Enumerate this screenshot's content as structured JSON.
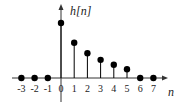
{
  "chart_data": {
    "type": "stem",
    "title": "",
    "ylabel": "h[n]",
    "xlabel": "n",
    "x": [
      -3,
      -2,
      -1,
      0,
      1,
      2,
      3,
      4,
      5,
      6,
      7
    ],
    "values": [
      0,
      0,
      0,
      1.0,
      0.64,
      0.45,
      0.33,
      0.24,
      0.16,
      0,
      0
    ],
    "tick_labels": [
      "-3",
      "-2",
      "-1",
      "0",
      "1",
      "2",
      "3",
      "4",
      "5",
      "6",
      "7"
    ],
    "xlim": [
      -3.5,
      7.6
    ],
    "ylim": [
      0,
      1.1
    ],
    "grid": false,
    "legend": null
  },
  "style": {
    "stem_color": "#000000",
    "axis_color": "#333333"
  }
}
